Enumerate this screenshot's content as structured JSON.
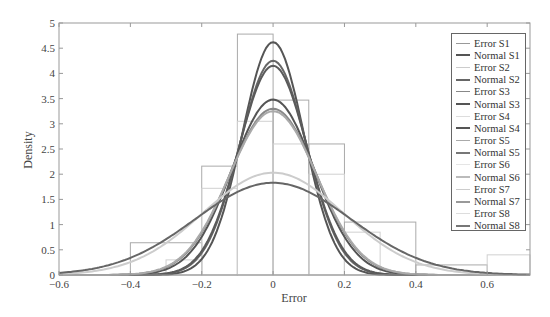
{
  "chart_data": {
    "type": "bar",
    "title": "",
    "xlabel": "Error",
    "ylabel": "Density",
    "xlim": [
      -0.6,
      0.72
    ],
    "ylim": [
      0,
      5
    ],
    "xticks": [
      "-0.6",
      "-0.4",
      "-0.2",
      "0",
      "0.2",
      "0.4",
      "0.6"
    ],
    "yticks": [
      "0",
      "0.5",
      "1",
      "1.5",
      "2",
      "2.5",
      "3",
      "3.5",
      "4",
      "4.5",
      "5"
    ],
    "grid": false,
    "legend_position": "upper right",
    "histogram_bins": [
      {
        "x0": -0.4,
        "x1": -0.2,
        "height": 0.64
      },
      {
        "x0": -0.3,
        "x1": -0.2,
        "height": 0.3
      },
      {
        "x0": -0.2,
        "x1": -0.1,
        "height": 2.16
      },
      {
        "x0": -0.2,
        "x1": -0.1,
        "height": 1.72
      },
      {
        "x0": -0.1,
        "x1": 0.0,
        "height": 4.78
      },
      {
        "x0": -0.1,
        "x1": 0.0,
        "height": 3.05
      },
      {
        "x0": 0.0,
        "x1": 0.1,
        "height": 3.47
      },
      {
        "x0": 0.0,
        "x1": 0.1,
        "height": 2.6
      },
      {
        "x0": 0.1,
        "x1": 0.2,
        "height": 2.6
      },
      {
        "x0": 0.1,
        "x1": 0.2,
        "height": 2.0
      },
      {
        "x0": 0.2,
        "x1": 0.4,
        "height": 1.05
      },
      {
        "x0": 0.2,
        "x1": 0.3,
        "height": 0.85
      },
      {
        "x0": 0.4,
        "x1": 0.6,
        "height": 0.2
      },
      {
        "x0": 0.6,
        "x1": 0.72,
        "height": 0.4
      }
    ],
    "series": [
      {
        "name": "Normal S1",
        "mean": 0.0,
        "peak": 4.62,
        "color": "#555555"
      },
      {
        "name": "Normal S2",
        "mean": 0.0,
        "peak": 4.25,
        "color": "#666666"
      },
      {
        "name": "Normal S3",
        "mean": 0.0,
        "peak": 4.15,
        "color": "#5a5a5a"
      },
      {
        "name": "Normal S4",
        "mean": 0.0,
        "peak": 3.48,
        "color": "#555555"
      },
      {
        "name": "Normal S5",
        "mean": 0.0,
        "peak": 3.3,
        "color": "#888888"
      },
      {
        "name": "Normal S6",
        "mean": 0.0,
        "peak": 3.25,
        "color": "#aaaaaa"
      },
      {
        "name": "Normal S7",
        "mean": 0.0,
        "peak": 2.03,
        "color": "#cccccc"
      },
      {
        "name": "Normal S8",
        "mean": 0.0,
        "peak": 1.83,
        "color": "#666666"
      }
    ]
  },
  "legend": {
    "items": [
      {
        "label": "Error S1",
        "color": "#999999",
        "w": 1
      },
      {
        "label": "Normal S1",
        "color": "#555555",
        "w": 2
      },
      {
        "label": "Error S2",
        "color": "#cccccc",
        "w": 1
      },
      {
        "label": "Normal S2",
        "color": "#666666",
        "w": 2
      },
      {
        "label": "Error S3",
        "color": "#888888",
        "w": 1
      },
      {
        "label": "Normal S3",
        "color": "#555555",
        "w": 2
      },
      {
        "label": "Error S4",
        "color": "#dddddd",
        "w": 1
      },
      {
        "label": "Normal S4",
        "color": "#555555",
        "w": 2
      },
      {
        "label": "Error S5",
        "color": "#aaaaaa",
        "w": 1
      },
      {
        "label": "Normal S5",
        "color": "#777777",
        "w": 2.5
      },
      {
        "label": "Error S6",
        "color": "#e5e5e5",
        "w": 1
      },
      {
        "label": "Normal S6",
        "color": "#bbbbbb",
        "w": 2
      },
      {
        "label": "Error S7",
        "color": "#cccccc",
        "w": 1
      },
      {
        "label": "Normal S7",
        "color": "#999999",
        "w": 2
      },
      {
        "label": "Error S8",
        "color": "#dddddd",
        "w": 1
      },
      {
        "label": "Normal S8",
        "color": "#777777",
        "w": 2
      }
    ]
  }
}
